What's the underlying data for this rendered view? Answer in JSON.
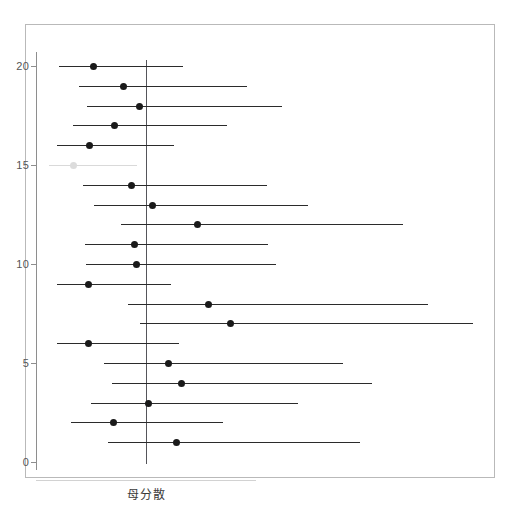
{
  "chart_data": {
    "type": "scatter",
    "title": "",
    "subtitle": "",
    "xlabel": "母分散",
    "ylabel": "",
    "grid": false,
    "legend": "none",
    "orientation": "horizontal",
    "reference_line": {
      "label": "母分散",
      "orientation": "vertical",
      "x_pixel": 146,
      "color": "#55555a"
    },
    "y_axis": {
      "ticks": [
        0,
        5,
        10,
        15,
        20
      ],
      "tick_labels": [
        "0",
        "5",
        "10",
        "15",
        "20"
      ],
      "ylim": [
        0,
        21.3
      ],
      "axis_color": "#8e8e8e",
      "label_color": "#555555"
    },
    "x_axis": {
      "ticks": [],
      "tick_labels": [],
      "visible": false
    },
    "colors": {
      "interval_normal": "#2b2b2b",
      "interval_highlight": "#d9d9d9",
      "point_normal": "#1a1a1a",
      "point_highlight": "#dcdcdc",
      "frame": "#b9b9b9",
      "background": "#ffffff"
    },
    "series": [
      {
        "name": "confidence intervals",
        "points": [
          {
            "id": 20,
            "label": "20",
            "lower_px": 59,
            "upper_px": 183,
            "estimate_px": 93,
            "highlight": false
          },
          {
            "id": 19,
            "label": "19",
            "lower_px": 79,
            "upper_px": 247,
            "estimate_px": 123,
            "highlight": false
          },
          {
            "id": 18,
            "label": "18",
            "lower_px": 87,
            "upper_px": 282,
            "estimate_px": 139,
            "highlight": false
          },
          {
            "id": 17,
            "label": "17",
            "lower_px": 73,
            "upper_px": 227,
            "estimate_px": 114,
            "highlight": false
          },
          {
            "id": 16,
            "label": "16",
            "lower_px": 57,
            "upper_px": 174,
            "estimate_px": 89,
            "highlight": false
          },
          {
            "id": 15,
            "label": "15",
            "lower_px": 49,
            "upper_px": 137,
            "estimate_px": 73,
            "highlight": true
          },
          {
            "id": 14,
            "label": "14",
            "lower_px": 83,
            "upper_px": 267,
            "estimate_px": 131,
            "highlight": false
          },
          {
            "id": 13,
            "label": "13",
            "lower_px": 94,
            "upper_px": 308,
            "estimate_px": 152,
            "highlight": false
          },
          {
            "id": 12,
            "label": "12",
            "lower_px": 121,
            "upper_px": 403,
            "estimate_px": 197,
            "highlight": false
          },
          {
            "id": 11,
            "label": "11",
            "lower_px": 85,
            "upper_px": 268,
            "estimate_px": 134,
            "highlight": false
          },
          {
            "id": 10,
            "label": "10",
            "lower_px": 86,
            "upper_px": 276,
            "estimate_px": 136,
            "highlight": false
          },
          {
            "id": 9,
            "label": "9",
            "lower_px": 57,
            "upper_px": 171,
            "estimate_px": 88,
            "highlight": false
          },
          {
            "id": 8,
            "label": "8",
            "lower_px": 128,
            "upper_px": 428,
            "estimate_px": 208,
            "highlight": false
          },
          {
            "id": 7,
            "label": "7",
            "lower_px": 140,
            "upper_px": 473,
            "estimate_px": 230,
            "highlight": false
          },
          {
            "id": 6,
            "label": "6",
            "lower_px": 57,
            "upper_px": 179,
            "estimate_px": 88,
            "highlight": false
          },
          {
            "id": 5,
            "label": "5",
            "lower_px": 104,
            "upper_px": 343,
            "estimate_px": 168,
            "highlight": false
          },
          {
            "id": 4,
            "label": "4",
            "lower_px": 112,
            "upper_px": 372,
            "estimate_px": 181,
            "highlight": false
          },
          {
            "id": 3,
            "label": "3",
            "lower_px": 91,
            "upper_px": 298,
            "estimate_px": 148,
            "highlight": false
          },
          {
            "id": 2,
            "label": "2",
            "lower_px": 71,
            "upper_px": 223,
            "estimate_px": 113,
            "highlight": false
          },
          {
            "id": 1,
            "label": "1",
            "lower_px": 108,
            "upper_px": 360,
            "estimate_px": 176,
            "highlight": false
          }
        ]
      }
    ]
  },
  "geometry": {
    "y_top_value": 20,
    "y_top_pixel": 66,
    "y_unit_pixels": 19.8
  }
}
